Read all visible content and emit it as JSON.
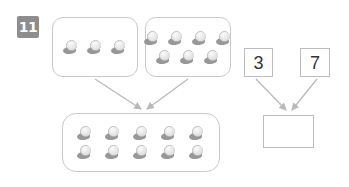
{
  "worksheet": {
    "question_number": "11",
    "background_color": "#ffffff",
    "line_color": "#c9c9c9",
    "badge_color": "#8d8d8d",
    "counter_icon": "counter-bean-icon"
  },
  "groups": {
    "left_box": {
      "name": "first-addend-group",
      "count": 3,
      "rows": [
        3
      ]
    },
    "right_box": {
      "name": "second-addend-group",
      "count": 7,
      "rows": [
        4,
        3
      ]
    },
    "total_box": {
      "name": "sum-group",
      "count": 10,
      "rows": [
        5,
        5
      ]
    }
  },
  "numbers": {
    "first_addend": "3",
    "second_addend": "7",
    "answer": ""
  },
  "arrows": [
    {
      "name": "arrow-left-group-to-total",
      "from": "left-box",
      "to": "total-box"
    },
    {
      "name": "arrow-right-group-to-total",
      "from": "right-box",
      "to": "total-box"
    },
    {
      "name": "arrow-three-to-answer",
      "from": "number-3",
      "to": "answer-box"
    },
    {
      "name": "arrow-seven-to-answer",
      "from": "number-7",
      "to": "answer-box"
    }
  ]
}
